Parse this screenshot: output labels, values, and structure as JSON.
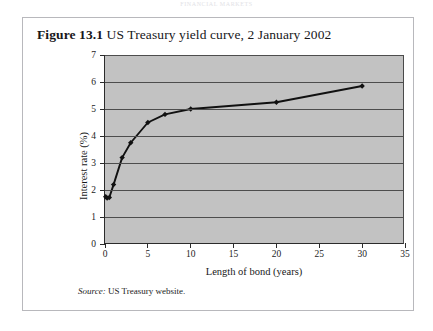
{
  "page": {
    "running_head": "FINANCIAL MARKETS"
  },
  "figure": {
    "label": "Figure 13.1",
    "caption": "US Treasury yield curve, 2 January 2002",
    "source_word": "Source:",
    "source_text": "US Treasury website."
  },
  "colors": {
    "plot_background": "#c2c2c2",
    "gridline": "#4d4d4d",
    "axis": "#2b2b2b",
    "series_line": "#111111",
    "marker": "#111111",
    "frame_border": "#b8b8bc",
    "page_background": "#ffffff"
  },
  "chart_data": {
    "type": "line",
    "title": "US Treasury yield curve, 2 January 2002",
    "subtitle": "",
    "xlabel": "Length of bond (years)",
    "ylabel": "Interest rate (%)",
    "xlim": [
      0,
      35
    ],
    "ylim": [
      0,
      7
    ],
    "xticks": [
      0,
      5,
      10,
      15,
      20,
      25,
      30,
      35
    ],
    "xtick_labels": [
      "0",
      "5",
      "10",
      "15",
      "20",
      "25",
      "30",
      "35"
    ],
    "yticks": [
      0,
      1,
      2,
      3,
      4,
      5,
      6,
      7
    ],
    "ytick_labels": [
      "0",
      "1",
      "2",
      "3",
      "4",
      "5",
      "6",
      "7"
    ],
    "grid": "horizontal",
    "legend": "none",
    "markers": "diamond",
    "series": [
      {
        "name": "US Treasury yield curve",
        "x": [
          0.08,
          0.25,
          0.5,
          1,
          2,
          3,
          5,
          7,
          10,
          20,
          30
        ],
        "y": [
          1.75,
          1.7,
          1.72,
          2.2,
          3.2,
          3.75,
          4.5,
          4.8,
          5.0,
          5.25,
          5.85
        ]
      }
    ],
    "source": "US Treasury website."
  }
}
